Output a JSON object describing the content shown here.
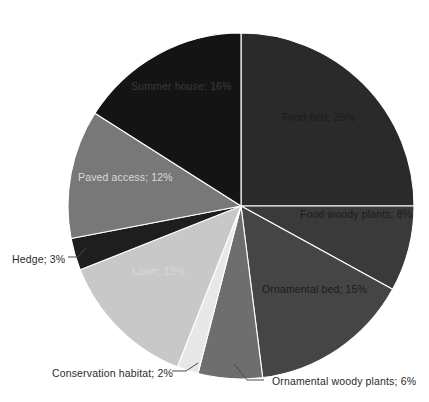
{
  "chart_data": {
    "type": "pie",
    "title": "",
    "subtitle": "",
    "xlabel": "",
    "ylabel": "",
    "legend_position": "none",
    "grid": false,
    "units": "percent",
    "total": 100,
    "start_angle_deg": 0,
    "direction": "clockwise",
    "categories": [
      "Food bed",
      "Food woody plants",
      "Ornamental bed",
      "Ornamental woody plants",
      "Conservation habitat",
      "Lawn",
      "Hedge",
      "Paved access",
      "Summer house"
    ],
    "values": [
      25,
      8,
      15,
      6,
      2,
      13,
      3,
      12,
      16
    ],
    "labels": [
      "Food bed; 25%",
      "Food woody plants; 8%",
      "Ornamental bed; 15%",
      "Ornamental woody plants; 6%",
      "Conservation habitat; 2%",
      "Lawn; 13%",
      "Hedge; 3%",
      "Paved access; 12%",
      "Summer house; 16%"
    ],
    "colors": [
      "#2a2a2a",
      "#3a3a3a",
      "#454545",
      "#6e6e6e",
      "#e8e8e8",
      "#c8c8c8",
      "#1e1e1e",
      "#787878",
      "#141414"
    ],
    "slices": [
      {
        "name": "Food bed",
        "value": 25,
        "label": "Food bed; 25%",
        "color": "#2a2a2a",
        "label_placement": "inside",
        "label_tone": "light",
        "lx": 282,
        "ly": 118
      },
      {
        "name": "Food woody plants",
        "value": 8,
        "label": "Food woody plants; 8%",
        "color": "#3a3a3a",
        "label_placement": "inside",
        "label_tone": "light",
        "lx": 300,
        "ly": 215
      },
      {
        "name": "Ornamental bed",
        "value": 15,
        "label": "Ornamental bed; 15%",
        "color": "#454545",
        "label_placement": "inside",
        "label_tone": "light",
        "lx": 262,
        "ly": 290
      },
      {
        "name": "Ornamental woody plants",
        "value": 6,
        "label": "Ornamental woody plants; 6%",
        "color": "#6e6e6e",
        "label_placement": "outside",
        "label_tone": "dark",
        "lx": 272,
        "ly": 382
      },
      {
        "name": "Conservation habitat",
        "value": 2,
        "label": "Conservation habitat; 2%",
        "color": "#e8e8e8",
        "label_placement": "outside",
        "label_tone": "dark",
        "lx": 52,
        "ly": 374
      },
      {
        "name": "Lawn",
        "value": 13,
        "label": "Lawn; 13%",
        "color": "#c8c8c8",
        "label_placement": "inside",
        "label_tone": "dark",
        "lx": 132,
        "ly": 272
      },
      {
        "name": "Hedge",
        "value": 3,
        "label": "Hedge; 3%",
        "color": "#1e1e1e",
        "label_placement": "outside",
        "label_tone": "dark",
        "lx": 12,
        "ly": 260
      },
      {
        "name": "Paved access",
        "value": 12,
        "label": "Paved access; 12%",
        "color": "#787878",
        "label_placement": "inside",
        "label_tone": "dark",
        "lx": 78,
        "ly": 178
      },
      {
        "name": "Summer house",
        "value": 16,
        "label": "Summer house; 16%",
        "color": "#141414",
        "label_placement": "inside",
        "label_tone": "verydark",
        "lx": 131,
        "ly": 87
      }
    ],
    "geometry": {
      "center_x": 241,
      "center_y": 206,
      "radius": 173
    },
    "leaders": [
      {
        "name": "ornamental-woody-plants-leader",
        "points": "264,380 247,380 234,364"
      },
      {
        "name": "conservation-habitat-leader",
        "points": "172,371 186,371 198,363"
      },
      {
        "name": "hedge-leader",
        "points": "68,257 78,257 86,248"
      }
    ]
  }
}
